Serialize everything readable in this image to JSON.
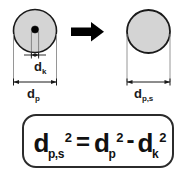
{
  "figure": {
    "kind": "technical-diagram",
    "background_color": "#ffffff",
    "line_color": "#1a1a1a",
    "particle_fill": "#d4d4d4",
    "core_fill": "#000000",
    "arrow_color": "#000000"
  },
  "left_particle": {
    "name": "particle-with-core",
    "dimension_inner": {
      "label_base": "d",
      "label_sub": "k",
      "label_text": "dk"
    },
    "dimension_outer": {
      "label_base": "d",
      "label_sub": "p",
      "label_text": "dp"
    }
  },
  "transform_arrow": {
    "name": "transformation-arrow",
    "direction": "right"
  },
  "right_particle": {
    "name": "solid-particle",
    "dimension_outer": {
      "label_base": "d",
      "label_sub": "p,s",
      "label_text": "dp,s"
    }
  },
  "formula": {
    "lhs": {
      "base": "d",
      "sub": "p,s",
      "sup": "2"
    },
    "equals": "=",
    "rhs_first": {
      "base": "d",
      "sub": "p",
      "sup": "2"
    },
    "minus": "-",
    "rhs_second": {
      "base": "d",
      "sub": "k",
      "sup": "2"
    },
    "plain_text": "dp,s^2 = dp^2 - dk^2"
  }
}
